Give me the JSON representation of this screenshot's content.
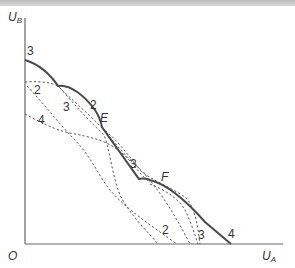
{
  "figure": {
    "type": "utility possibility frontier diagram",
    "axes": {
      "y_label_main": "U",
      "y_label_sub": "B",
      "x_label_main": "U",
      "x_label_sub": "A",
      "origin_label": "O"
    },
    "envelope_labels": {
      "start": "3",
      "segment_2": "2",
      "point_E": "E",
      "segment_3": "3",
      "point_F": "F",
      "end": "4"
    },
    "dashed_curve_labels": {
      "curve_2_upper": "2",
      "curve_3_upper": "3",
      "curve_4_upper": "4",
      "curve_2_lower": "2",
      "curve_3_lower": "3"
    },
    "colors": {
      "envelope": "#4a4a4a",
      "dashed": "#555555",
      "axis": "#666666",
      "text": "#333333",
      "top_strip": "#c8c8c8"
    }
  }
}
